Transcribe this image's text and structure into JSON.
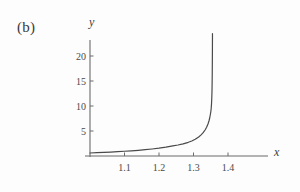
{
  "figure": {
    "panel_label": "(b)",
    "background_color": "#fdfdfd",
    "line_color": "#4a4a4a",
    "axis_color": "#6b6b6b",
    "text_color": "#3d3d3d"
  },
  "chart_data": {
    "type": "line",
    "title": "",
    "subtitle": "",
    "panel": "(b)",
    "xlabel": "x",
    "ylabel": "y",
    "grid": false,
    "legend": null,
    "xlim": [
      1.0,
      1.43
    ],
    "ylim": [
      0,
      24.5
    ],
    "xticks": [
      1.1,
      1.2,
      1.3,
      1.4
    ],
    "xtick_labels": [
      "1.1",
      "1.2",
      "1.3",
      "1.4"
    ],
    "yticks": [
      5,
      10,
      15,
      20
    ],
    "ytick_labels": [
      "5",
      "10",
      "15",
      "20"
    ],
    "annotations": [],
    "asymptote_x": 1.355,
    "series": [
      {
        "name": "y(x)",
        "x": [
          1.0,
          1.02,
          1.04,
          1.06,
          1.08,
          1.1,
          1.12,
          1.14,
          1.16,
          1.18,
          1.2,
          1.22,
          1.24,
          1.255,
          1.27,
          1.285,
          1.295,
          1.305,
          1.315,
          1.322,
          1.328,
          1.334,
          1.338,
          1.342,
          1.345,
          1.347,
          1.349,
          1.3505,
          1.3515,
          1.3523,
          1.353,
          1.3535,
          1.354,
          1.3543,
          1.3546,
          1.3548,
          1.355
        ],
        "y": [
          0.6,
          0.66,
          0.72,
          0.79,
          0.86,
          0.95,
          1.04,
          1.14,
          1.26,
          1.4,
          1.56,
          1.76,
          2.02,
          2.2,
          2.44,
          2.74,
          3.0,
          3.34,
          3.8,
          4.22,
          4.66,
          5.25,
          5.75,
          6.4,
          7.05,
          7.6,
          8.35,
          9.0,
          9.7,
          10.5,
          11.6,
          12.7,
          14.5,
          16.2,
          18.8,
          21.0,
          24.0
        ]
      }
    ]
  },
  "geometry": {
    "x_axis_y_px": 156,
    "y_axis_x_px": 90,
    "x_axis_left_px": 85,
    "x_axis_right_px": 268,
    "y_axis_top_px": 40,
    "y_axis_bottom_px": 157,
    "x_px_per_unit": 345,
    "x_origin_value": 1.0,
    "x_origin_px": 90,
    "y_px_per_unit": 5,
    "y_zero_px": 156
  }
}
